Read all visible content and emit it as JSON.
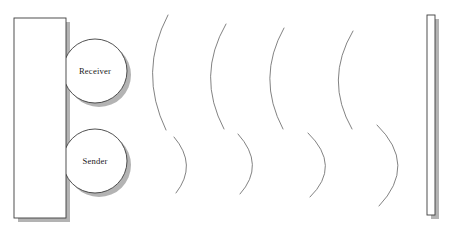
{
  "diagram": {
    "type": "ultrasonic-sensor-wave-propagation",
    "background_color": "#ffffff",
    "stroke_color": "#3d3d3d",
    "wave_stroke_color": "#6b6b6b",
    "shadow_color": "#9a9a9a",
    "fill_color": "#ffffff",
    "device_body": {
      "name": "sensor-housing",
      "x": 14,
      "y": 18,
      "width": 52,
      "height": 200,
      "shadow_offset": 4
    },
    "transducers": [
      {
        "name": "receiver",
        "label": "Receiver",
        "cx": 95,
        "cy": 71,
        "r": 32,
        "shadow_offset": 4
      },
      {
        "name": "sender",
        "label": "Sender",
        "cx": 95,
        "cy": 161,
        "r": 32,
        "shadow_offset": 4
      }
    ],
    "target_wall": {
      "name": "reflecting-wall",
      "x": 427,
      "y": 15,
      "width": 8,
      "height": 200,
      "shadow_offset": 4
    },
    "outgoing_waves": {
      "name": "emitted-wavefronts",
      "count": 4,
      "direction": "rightward-from-sender",
      "concavity": "right",
      "arcs": [
        {
          "top_x": 168,
          "top_y": 15,
          "mid_x": 147,
          "mid_y": 72,
          "bot_x": 166,
          "bot_y": 130
        },
        {
          "top_x": 226,
          "top_y": 24,
          "mid_x": 205,
          "mid_y": 76,
          "bot_x": 224,
          "bot_y": 129
        },
        {
          "top_x": 284,
          "top_y": 28,
          "mid_x": 265,
          "mid_y": 78,
          "bot_x": 283,
          "bot_y": 129
        },
        {
          "top_x": 353,
          "top_y": 31,
          "mid_x": 333,
          "mid_y": 80,
          "bot_x": 352,
          "bot_y": 129
        }
      ]
    },
    "reflected_waves": {
      "name": "reflected-wavefronts",
      "count": 4,
      "direction": "leftward-to-receiver",
      "concavity": "left",
      "arcs": [
        {
          "top_x": 174,
          "top_y": 137,
          "mid_x": 189,
          "mid_y": 165,
          "bot_x": 176,
          "bot_y": 193
        },
        {
          "top_x": 238,
          "top_y": 134,
          "mid_x": 256,
          "mid_y": 165,
          "bot_x": 240,
          "bot_y": 194
        },
        {
          "top_x": 308,
          "top_y": 133,
          "mid_x": 329,
          "mid_y": 166,
          "bot_x": 310,
          "bot_y": 197
        },
        {
          "top_x": 377,
          "top_y": 125,
          "mid_x": 402,
          "mid_y": 165,
          "bot_x": 379,
          "bot_y": 206
        }
      ]
    }
  }
}
